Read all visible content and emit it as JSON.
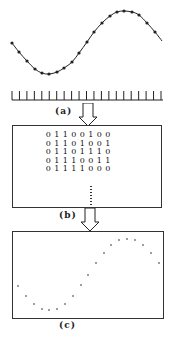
{
  "figure": {
    "panels": [
      {
        "id": "a",
        "label": "(a)",
        "description": "Continuous sine wave sampled at discrete points with sampling tick marks"
      },
      {
        "id": "b",
        "label": "(b)",
        "description": "Binary encoded sample values"
      },
      {
        "id": "c",
        "label": "(c)",
        "description": "Reconstructed discrete sample points"
      }
    ],
    "panel_a": {
      "curve_points": [
        [
          12,
          43
        ],
        [
          19,
          52
        ],
        [
          27,
          61
        ],
        [
          35,
          69
        ],
        [
          42,
          73
        ],
        [
          49,
          74
        ],
        [
          57,
          72
        ],
        [
          64,
          68
        ],
        [
          72,
          62
        ],
        [
          79,
          53
        ],
        [
          87,
          42
        ],
        [
          94,
          32
        ],
        [
          102,
          23
        ],
        [
          110,
          16
        ],
        [
          117,
          12
        ],
        [
          124,
          11
        ],
        [
          132,
          12
        ],
        [
          139,
          15
        ],
        [
          147,
          23
        ],
        [
          155,
          32
        ],
        [
          162,
          41
        ]
      ],
      "sample_points": [
        [
          12,
          43
        ],
        [
          19,
          52
        ],
        [
          27,
          61
        ],
        [
          35,
          69
        ],
        [
          42,
          73
        ],
        [
          49,
          74
        ],
        [
          57,
          72
        ],
        [
          64,
          68
        ],
        [
          72,
          62
        ],
        [
          79,
          53
        ],
        [
          87,
          42
        ],
        [
          94,
          32
        ],
        [
          102,
          23
        ],
        [
          110,
          16
        ],
        [
          117,
          12
        ],
        [
          124,
          11
        ],
        [
          132,
          12
        ],
        [
          139,
          15
        ],
        [
          147,
          23
        ],
        [
          155,
          32
        ]
      ],
      "tick_count": 21,
      "tick_start_x": 12,
      "tick_spacing": 7.45,
      "baseline_y": 100,
      "tick_top_y": 91,
      "baseline_end_x": 163
    },
    "panel_b": {
      "rows": [
        [
          "0",
          "1",
          "1",
          "0",
          "0",
          "1",
          "0",
          "0"
        ],
        [
          "0",
          "1",
          "1",
          "0",
          "1",
          "0",
          "0",
          "1"
        ],
        [
          "0",
          "1",
          "1",
          "0",
          "1",
          "1",
          "1",
          "0"
        ],
        [
          "0",
          "1",
          "1",
          "1",
          "0",
          "0",
          "1",
          "1"
        ],
        [
          "0",
          "1",
          "1",
          "1",
          "1",
          "0",
          "0",
          "0"
        ]
      ],
      "continuation": "⋮"
    },
    "panel_c": {
      "dots": [
        [
          18,
          286
        ],
        [
          26,
          296
        ],
        [
          34,
          304
        ],
        [
          42,
          309
        ],
        [
          49,
          310
        ],
        [
          57,
          309
        ],
        [
          65,
          304
        ],
        [
          73,
          296
        ],
        [
          81,
          285
        ],
        [
          88,
          275
        ],
        [
          96,
          263
        ],
        [
          104,
          253
        ],
        [
          111,
          245
        ],
        [
          119,
          240
        ],
        [
          127,
          239
        ],
        [
          135,
          240
        ],
        [
          143,
          245
        ],
        [
          151,
          253
        ],
        [
          159,
          263
        ]
      ]
    },
    "colors": {
      "line": "#222222",
      "background": "#ffffff"
    }
  }
}
